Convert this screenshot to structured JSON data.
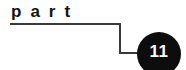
{
  "diagram": {
    "type": "callout-label",
    "background_color": "#ffffff",
    "heading": {
      "text": "part",
      "color": "#141414",
      "style": "bold-letterspaced"
    },
    "badge": {
      "number": "11",
      "shape": "circle",
      "fill_color": "#0d0d0d",
      "text_color": "#ffffff"
    },
    "connector": {
      "name": "step-leader-line",
      "color": "#3a3a3a",
      "stroke_width": 1,
      "points": "10,24 120,24 120,53 143,53"
    }
  }
}
